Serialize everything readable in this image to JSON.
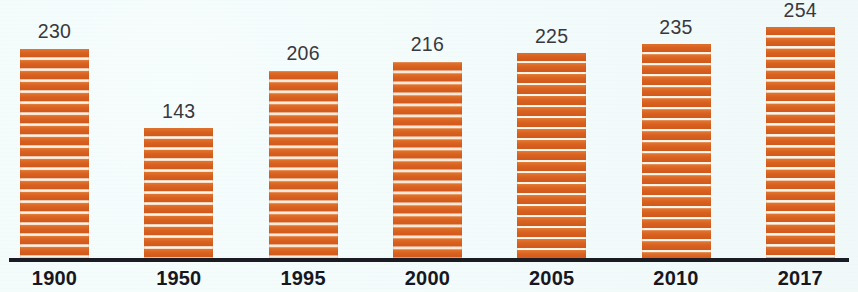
{
  "chart_data": {
    "type": "bar",
    "title": "",
    "subtitle": "",
    "xlabel": "",
    "ylabel": "",
    "categories": [
      "1900",
      "1950",
      "1995",
      "2000",
      "2005",
      "2010",
      "2017"
    ],
    "values": [
      230,
      143,
      206,
      216,
      225,
      235,
      254
    ],
    "series": [
      {
        "name": "",
        "values": [
          230,
          143,
          206,
          216,
          225,
          235,
          254
        ]
      }
    ],
    "data_labels": [
      "230",
      "143",
      "206",
      "216",
      "225",
      "235",
      "254"
    ],
    "ylim": [
      0,
      254
    ],
    "grid": false,
    "legend": null,
    "legend_position": "none",
    "annotations": [],
    "bar_color": "#dd6a2c",
    "bar_texture": "horizontal-stripes",
    "label_color": "#39383f",
    "axis_label_color": "#17171f",
    "axis_line_color": "#1b1b23",
    "background_color": "#f3fbfa"
  },
  "layout": {
    "baseline_y": 258,
    "px_per_unit": 0.909,
    "bar_width": 69,
    "bar_pitch": 124.3,
    "first_bar_left": 20
  }
}
